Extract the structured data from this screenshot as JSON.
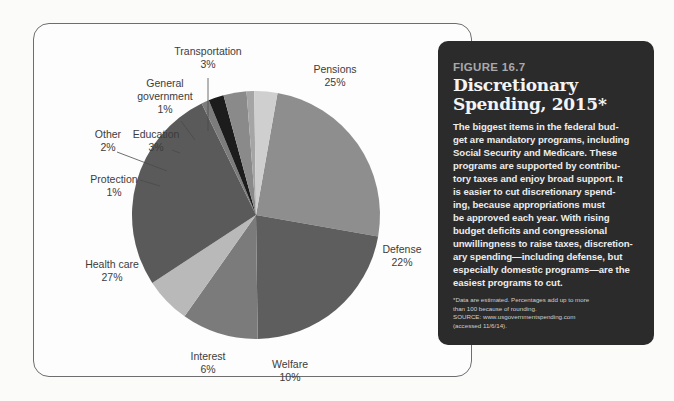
{
  "panel": {
    "figure_number": "FIGURE 16.7",
    "title_lines": [
      "Discretionary",
      "Spending, 2015*"
    ],
    "body_lines": [
      "The biggest items in the federal bud-",
      "get are mandatory programs, including",
      "Social Security and Medicare. These",
      "programs are supported by contribu-",
      "tory taxes and enjoy broad support. It",
      "is easier to cut discretionary spend-",
      "ing, because appropriations must",
      "be approved each year. With rising",
      "budget deficits and congressional",
      "unwillingness to raise taxes, discretion-",
      "ary spending—including defense, but",
      "especially domestic programs—are the",
      "easiest programs to cut."
    ],
    "note_lines": [
      "*Data are estimated. Percentages add up to more",
      "than 100 because of rounding.",
      "SOURCE: www.usgovernmentspending.com",
      "(accessed 11/6/14)."
    ]
  },
  "chart_data": {
    "type": "pie",
    "title": "Discretionary Spending, 2015*",
    "unit": "%",
    "start": "Pensions slice begins just right of 12 o'clock, proceeding clockwise",
    "slices": [
      {
        "label": "Pensions",
        "label_lines": [
          "Pensions"
        ],
        "value": 25,
        "color": "#8e8e8e"
      },
      {
        "label": "Defense",
        "label_lines": [
          "Defense"
        ],
        "value": 22,
        "color": "#5e5e5e"
      },
      {
        "label": "Welfare",
        "label_lines": [
          "Welfare"
        ],
        "value": 10,
        "color": "#7b7b7b"
      },
      {
        "label": "Interest",
        "label_lines": [
          "Interest"
        ],
        "value": 6,
        "color": "#b9b9b9"
      },
      {
        "label": "Health care",
        "label_lines": [
          "Health care"
        ],
        "value": 27,
        "color": "#5a5a5a"
      },
      {
        "label": "Protection",
        "label_lines": [
          "Protection"
        ],
        "value": 1,
        "color": "#7c7c7c"
      },
      {
        "label": "Other",
        "label_lines": [
          "Other"
        ],
        "value": 2,
        "color": "#1c1c1c"
      },
      {
        "label": "Education",
        "label_lines": [
          "Education"
        ],
        "value": 3,
        "color": "#8a8a8a"
      },
      {
        "label": "General government",
        "label_lines": [
          "General",
          "government"
        ],
        "value": 1,
        "color": "#a5a5a5"
      },
      {
        "label": "Transportation",
        "label_lines": [
          "Transportation"
        ],
        "value": 3,
        "color": "#cfcfcf"
      }
    ]
  }
}
